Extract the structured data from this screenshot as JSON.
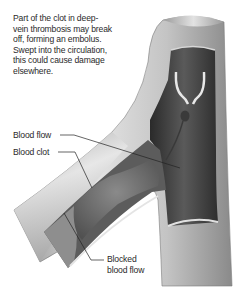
{
  "diagram": {
    "intro_text": "Part of the clot in deep-vein thrombosis may break off, forming an embolus. Swept into the circulation, this could cause damage elsewhere.",
    "labels": {
      "blood_flow": "Blood flow",
      "blood_clot": "Blood clot",
      "blocked_line1": "Blocked",
      "blocked_line2": "blood flow"
    },
    "colors": {
      "vein_wall_light": "#e4e4e4",
      "vein_wall_mid": "#a8a8a8",
      "vein_interior_dark": "#3a3a3a",
      "clot": "#6a6a6a",
      "leader_line": "#222222",
      "text": "#2a2a2a"
    }
  }
}
